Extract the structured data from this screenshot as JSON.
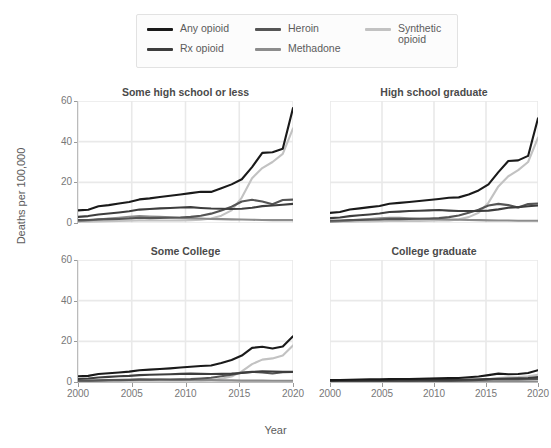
{
  "chart_data": {
    "type": "line",
    "title": "",
    "xlabel": "Year",
    "ylabel": "Deaths per 100,000",
    "xlim": [
      2000,
      2020
    ],
    "ylim": [
      0,
      60
    ],
    "yticks": [
      0,
      20,
      40,
      60
    ],
    "xticks": [
      2000,
      2005,
      2010,
      2015,
      2020
    ],
    "grid": true,
    "legend_position": "top",
    "x": [
      2000,
      2001,
      2002,
      2003,
      2004,
      2005,
      2006,
      2007,
      2008,
      2009,
      2010,
      2011,
      2012,
      2013,
      2014,
      2015,
      2016,
      2017,
      2018,
      2019,
      2020
    ],
    "facets": [
      {
        "name": "Some high school or less",
        "series": [
          {
            "name": "Any opioid",
            "color": "#1a1a1a",
            "values": [
              6.2,
              6.5,
              8.2,
              8.8,
              9.6,
              10.3,
              11.6,
              12.1,
              12.8,
              13.4,
              14.0,
              14.7,
              15.4,
              15.3,
              17.1,
              19.0,
              21.5,
              27.5,
              34.5,
              34.8,
              36.5,
              56.5
            ]
          },
          {
            "name": "Rx opioid",
            "color": "#3d3d3d",
            "values": [
              3.0,
              3.4,
              4.2,
              4.7,
              5.2,
              5.8,
              6.6,
              6.9,
              7.2,
              7.4,
              7.6,
              7.8,
              7.4,
              7.1,
              7.0,
              6.9,
              7.0,
              7.5,
              8.3,
              8.6,
              9.0,
              9.4
            ]
          },
          {
            "name": "Heroin",
            "color": "#555555",
            "values": [
              1.4,
              1.5,
              1.8,
              1.9,
              2.0,
              2.2,
              2.6,
              2.4,
              2.5,
              2.6,
              2.7,
              3.0,
              3.6,
              4.6,
              6.2,
              8.0,
              10.6,
              11.4,
              10.6,
              9.2,
              11.3,
              11.5
            ]
          },
          {
            "name": "Methadone",
            "color": "#8c8c8c",
            "values": [
              0.9,
              1.2,
              1.7,
              2.2,
              2.6,
              3.0,
              3.4,
              3.2,
              3.0,
              2.8,
              2.6,
              2.4,
              2.2,
              2.0,
              1.9,
              1.8,
              1.7,
              1.6,
              1.5,
              1.4,
              1.4,
              1.4
            ]
          },
          {
            "name": "Synthetic opioid",
            "color": "#c2c2c2",
            "values": [
              0.6,
              0.7,
              0.8,
              0.9,
              1.0,
              1.1,
              1.3,
              1.2,
              1.2,
              1.2,
              1.3,
              1.4,
              1.6,
              2.2,
              3.6,
              6.2,
              12.5,
              22.0,
              27.0,
              30.0,
              34.0,
              46.5
            ]
          }
        ]
      },
      {
        "name": "High school graduate",
        "series": [
          {
            "name": "Any opioid",
            "color": "#1a1a1a",
            "values": [
              5.0,
              5.4,
              6.6,
              7.2,
              7.8,
              8.4,
              9.5,
              9.9,
              10.3,
              10.8,
              11.3,
              11.8,
              12.4,
              12.6,
              14.0,
              16.0,
              19.0,
              25.0,
              30.5,
              30.8,
              33.0,
              51.5
            ]
          },
          {
            "name": "Rx opioid",
            "color": "#3d3d3d",
            "values": [
              2.4,
              2.7,
              3.4,
              3.8,
              4.2,
              4.7,
              5.4,
              5.6,
              5.9,
              6.0,
              6.2,
              6.4,
              6.1,
              5.9,
              5.9,
              5.9,
              6.1,
              6.7,
              7.5,
              7.8,
              8.2,
              8.6
            ]
          },
          {
            "name": "Heroin",
            "color": "#555555",
            "values": [
              1.1,
              1.2,
              1.4,
              1.5,
              1.6,
              1.7,
              2.0,
              1.9,
              2.0,
              2.1,
              2.2,
              2.4,
              2.9,
              3.7,
              5.0,
              6.5,
              8.6,
              9.4,
              8.8,
              7.6,
              9.3,
              9.6
            ]
          },
          {
            "name": "Methadone",
            "color": "#8c8c8c",
            "values": [
              0.7,
              0.9,
              1.3,
              1.7,
              2.0,
              2.3,
              2.6,
              2.5,
              2.3,
              2.1,
              2.0,
              1.9,
              1.7,
              1.6,
              1.5,
              1.4,
              1.3,
              1.2,
              1.2,
              1.1,
              1.1,
              1.1
            ]
          },
          {
            "name": "Synthetic opioid",
            "color": "#c2c2c2",
            "values": [
              0.5,
              0.6,
              0.7,
              0.8,
              0.8,
              0.9,
              1.0,
              1.0,
              1.0,
              1.0,
              1.1,
              1.2,
              1.3,
              1.8,
              2.9,
              5.0,
              10.0,
              18.0,
              23.0,
              26.0,
              30.0,
              42.0
            ]
          }
        ]
      },
      {
        "name": "Some College",
        "series": [
          {
            "name": "Any opioid",
            "color": "#1a1a1a",
            "values": [
              2.8,
              3.0,
              3.9,
              4.3,
              4.7,
              5.1,
              5.8,
              6.1,
              6.4,
              6.7,
              7.1,
              7.5,
              7.9,
              8.1,
              9.3,
              10.8,
              13.0,
              16.8,
              17.3,
              16.5,
              17.5,
              22.5
            ]
          },
          {
            "name": "Rx opioid",
            "color": "#3d3d3d",
            "values": [
              1.5,
              1.7,
              2.2,
              2.5,
              2.8,
              3.0,
              3.4,
              3.6,
              3.7,
              3.8,
              4.0,
              4.1,
              4.0,
              3.9,
              4.0,
              4.1,
              4.4,
              4.9,
              5.3,
              5.2,
              5.0,
              5.0
            ]
          },
          {
            "name": "Heroin",
            "color": "#555555",
            "values": [
              0.6,
              0.7,
              0.8,
              0.9,
              0.9,
              1.0,
              1.1,
              1.1,
              1.2,
              1.2,
              1.3,
              1.4,
              1.7,
              2.1,
              2.8,
              3.6,
              4.6,
              5.0,
              4.7,
              4.2,
              4.8,
              4.9
            ]
          },
          {
            "name": "Methadone",
            "color": "#8c8c8c",
            "values": [
              0.4,
              0.5,
              0.7,
              0.9,
              1.1,
              1.2,
              1.4,
              1.3,
              1.2,
              1.1,
              1.1,
              1.0,
              0.9,
              0.9,
              0.8,
              0.8,
              0.7,
              0.7,
              0.7,
              0.6,
              0.6,
              0.6
            ]
          },
          {
            "name": "Synthetic opioid",
            "color": "#c2c2c2",
            "values": [
              0.3,
              0.3,
              0.4,
              0.4,
              0.5,
              0.5,
              0.6,
              0.6,
              0.6,
              0.6,
              0.6,
              0.7,
              0.8,
              1.0,
              1.6,
              2.7,
              5.2,
              8.8,
              11.0,
              11.6,
              13.0,
              18.0
            ]
          }
        ]
      },
      {
        "name": "College graduate",
        "series": [
          {
            "name": "Any opioid",
            "color": "#1a1a1a",
            "values": [
              0.9,
              1.0,
              1.1,
              1.2,
              1.3,
              1.3,
              1.4,
              1.5,
              1.5,
              1.6,
              1.7,
              1.8,
              1.9,
              2.0,
              2.3,
              2.7,
              3.4,
              4.1,
              3.8,
              3.9,
              4.4,
              5.8
            ]
          },
          {
            "name": "Rx opioid",
            "color": "#3d3d3d",
            "values": [
              0.5,
              0.6,
              0.7,
              0.7,
              0.8,
              0.8,
              0.9,
              0.9,
              0.9,
              1.0,
              1.0,
              1.1,
              1.1,
              1.1,
              1.2,
              1.3,
              1.4,
              1.6,
              1.7,
              1.8,
              2.0,
              2.4
            ]
          },
          {
            "name": "Heroin",
            "color": "#555555",
            "values": [
              0.2,
              0.2,
              0.3,
              0.3,
              0.3,
              0.3,
              0.4,
              0.4,
              0.4,
              0.4,
              0.4,
              0.5,
              0.5,
              0.6,
              0.8,
              1.0,
              1.3,
              1.4,
              1.3,
              1.2,
              1.4,
              1.5
            ]
          },
          {
            "name": "Methadone",
            "color": "#8c8c8c",
            "values": [
              0.1,
              0.2,
              0.2,
              0.3,
              0.3,
              0.4,
              0.4,
              0.4,
              0.4,
              0.3,
              0.3,
              0.3,
              0.3,
              0.3,
              0.2,
              0.2,
              0.2,
              0.2,
              0.2,
              0.2,
              0.2,
              0.2
            ]
          },
          {
            "name": "Synthetic opioid",
            "color": "#c2c2c2",
            "values": [
              0.1,
              0.1,
              0.1,
              0.1,
              0.2,
              0.2,
              0.2,
              0.2,
              0.2,
              0.2,
              0.2,
              0.2,
              0.2,
              0.3,
              0.5,
              0.8,
              1.3,
              2.0,
              2.3,
              2.4,
              2.8,
              3.6
            ]
          }
        ]
      }
    ],
    "legend": [
      {
        "label": "Any opioid",
        "color": "#1a1a1a"
      },
      {
        "label": "Rx opioid",
        "color": "#3d3d3d"
      },
      {
        "label": "Heroin",
        "color": "#555555"
      },
      {
        "label": "Methadone",
        "color": "#8c8c8c"
      },
      {
        "label": "Synthetic opioid",
        "color": "#c2c2c2"
      }
    ]
  }
}
